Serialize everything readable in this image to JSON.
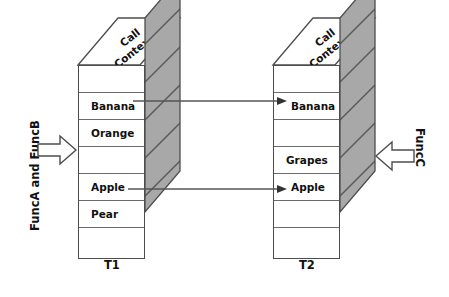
{
  "diagram": {
    "title_hidden": "",
    "colors": {
      "side_fill": "#a8a8a8",
      "hatch_line": "#555555",
      "outline": "#4d4d4d",
      "row_line": "#6b6b6b",
      "arrow_outline": "#4d4d4d",
      "connector": "#555555",
      "text": "#111111",
      "background": "#ffffff"
    },
    "stacks": [
      {
        "id": "t1",
        "top_label_line1": "Call",
        "top_label_line2": "Context 1",
        "bottom_label": "T1",
        "cells": [
          {
            "label": "",
            "align": "left"
          },
          {
            "label": "Banana",
            "align": "left"
          },
          {
            "label": "Orange",
            "align": "left"
          },
          {
            "label": "",
            "align": "left"
          },
          {
            "label": "Apple",
            "align": "left"
          },
          {
            "label": "Pear",
            "align": "left"
          },
          {
            "label": "",
            "align": "left"
          }
        ]
      },
      {
        "id": "t2",
        "top_label_line1": "Call",
        "top_label_line2": "Context 2",
        "bottom_label": "T2",
        "cells": [
          {
            "label": "",
            "align": "right"
          },
          {
            "label": "Banana",
            "align": "right"
          },
          {
            "label": "",
            "align": "right"
          },
          {
            "label": "Grapes",
            "align": "right"
          },
          {
            "label": "Apple",
            "align": "right"
          },
          {
            "label": "",
            "align": "right"
          },
          {
            "label": "",
            "align": "right"
          }
        ]
      }
    ],
    "side_captions": [
      {
        "id": "left",
        "text": "FuncA and FuncB",
        "arrow_direction": "right"
      },
      {
        "id": "right",
        "text": "FuncC",
        "arrow_direction": "left"
      }
    ],
    "connectors": [
      {
        "from": "t1.Banana",
        "to": "t2.Banana",
        "label": "Banana"
      },
      {
        "from": "t1.Apple",
        "to": "t2.Apple",
        "label": "Apple"
      }
    ]
  }
}
